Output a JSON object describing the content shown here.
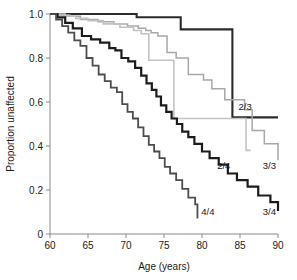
{
  "chart_data": {
    "type": "line",
    "title": "",
    "xlabel": "Age (years)",
    "ylabel": "Proportion unaffected",
    "xlim": [
      60,
      90
    ],
    "ylim": [
      0,
      1.0
    ],
    "xticks": [
      60,
      65,
      70,
      75,
      80,
      85,
      90
    ],
    "xtick_labels": [
      "60",
      "65",
      "70",
      "75",
      "80",
      "85",
      "90"
    ],
    "yticks": [
      0,
      0.2,
      0.4,
      0.6,
      0.8,
      1.0
    ],
    "ytick_labels": [
      "0",
      "0.2",
      "0.4",
      "0.6",
      "0.8",
      "1.0"
    ],
    "grid": false,
    "legend_position": "inline-end-of-curve",
    "step_style": "post",
    "series": [
      {
        "name": "2/3",
        "label": "2/3",
        "color": "#2b2b2b",
        "width": 2.1,
        "label_x": 84.8,
        "label_y": 0.565,
        "x": [
          60,
          63.0,
          65.6,
          70.5,
          71.4,
          75.2,
          77.2,
          79.4,
          84.0,
          84.0,
          90.0
        ],
        "y": [
          1.0,
          1.0,
          1.0,
          1.0,
          0.985,
          0.985,
          0.93,
          0.93,
          0.81,
          0.53,
          0.53
        ]
      },
      {
        "name": "3/3",
        "label": "3/3",
        "color": "#a8a8a8",
        "width": 1.5,
        "label_x": 88.0,
        "label_y": 0.295,
        "x": [
          60,
          61.3,
          62.6,
          64.0,
          66.3,
          68.4,
          70.2,
          71.6,
          72.6,
          73.3,
          74.2,
          75.4,
          76.6,
          78.2,
          80.2,
          81.3,
          83.0,
          85.6,
          86.6,
          88.2,
          90.0
        ],
        "y": [
          1.0,
          0.995,
          0.99,
          0.975,
          0.965,
          0.955,
          0.945,
          0.935,
          0.925,
          0.915,
          0.9,
          0.825,
          0.8,
          0.725,
          0.7,
          0.66,
          0.61,
          0.565,
          0.47,
          0.41,
          0.335
        ]
      },
      {
        "name": "2/4",
        "label": "2/4",
        "color": "#c2c2c2",
        "width": 1.6,
        "label_x": 82.0,
        "label_y": 0.295,
        "x": [
          60,
          62.0,
          63.4,
          65.0,
          67.0,
          69.2,
          71.0,
          72.0,
          73.0,
          73.0,
          76.3,
          76.3,
          82.4,
          85.8,
          85.8,
          86.4
        ],
        "y": [
          1.0,
          0.99,
          0.98,
          0.97,
          0.955,
          0.94,
          0.925,
          0.91,
          0.895,
          0.79,
          0.71,
          0.525,
          0.525,
          0.525,
          0.38,
          0.38
        ]
      },
      {
        "name": "3/4",
        "label": "3/4",
        "color": "#1c1c1c",
        "width": 2.2,
        "label_x": 88.0,
        "label_y": 0.085,
        "x": [
          60,
          61.0,
          62.0,
          63.0,
          64.2,
          65.4,
          66.6,
          67.8,
          68.6,
          69.4,
          70.3,
          71.2,
          72.0,
          72.7,
          73.4,
          74.0,
          74.6,
          75.3,
          76.0,
          76.7,
          77.4,
          78.2,
          79.0,
          80.0,
          81.0,
          82.2,
          83.4,
          84.6,
          86.0,
          87.4,
          89.0,
          90.0
        ],
        "y": [
          1.0,
          0.985,
          0.96,
          0.935,
          0.9,
          0.885,
          0.87,
          0.845,
          0.835,
          0.8,
          0.785,
          0.755,
          0.72,
          0.685,
          0.655,
          0.625,
          0.585,
          0.555,
          0.525,
          0.5,
          0.465,
          0.44,
          0.41,
          0.375,
          0.345,
          0.315,
          0.275,
          0.245,
          0.215,
          0.175,
          0.145,
          0.105
        ]
      },
      {
        "name": "4/4",
        "label": "4/4",
        "color": "#4d4d4d",
        "width": 1.8,
        "label_x": 79.9,
        "label_y": 0.085,
        "x": [
          60,
          60.8,
          61.6,
          62.4,
          63.2,
          64.0,
          64.8,
          65.6,
          66.4,
          67.2,
          68.0,
          68.8,
          69.5,
          70.2,
          70.9,
          71.6,
          72.3,
          73.0,
          73.7,
          74.4,
          75.1,
          75.8,
          76.6,
          77.4,
          78.2,
          79.1,
          79.4
        ],
        "y": [
          1.0,
          0.975,
          0.945,
          0.915,
          0.88,
          0.855,
          0.8,
          0.765,
          0.725,
          0.695,
          0.665,
          0.645,
          0.59,
          0.555,
          0.525,
          0.485,
          0.445,
          0.405,
          0.375,
          0.345,
          0.305,
          0.275,
          0.245,
          0.205,
          0.165,
          0.135,
          0.07
        ]
      }
    ]
  }
}
